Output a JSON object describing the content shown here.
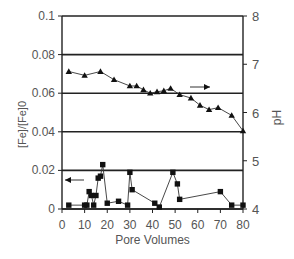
{
  "chart_data": {
    "type": "line",
    "title": "",
    "xlabel": "Pore Volumes",
    "ylabel_left": "[Fe]/[Fe]0",
    "ylabel_right": "pH",
    "xlim": [
      0,
      80
    ],
    "ylim_left": [
      0,
      0.1
    ],
    "ylim_right": [
      4,
      8
    ],
    "x_ticks": [
      "0",
      "10",
      "20",
      "30",
      "40",
      "50",
      "60",
      "70",
      "80"
    ],
    "y_ticks_left": [
      "0",
      "0.02",
      "0.04",
      "0.06",
      "0.08",
      "0.1"
    ],
    "y_ticks_right": [
      "4",
      "5",
      "6",
      "7",
      "8"
    ],
    "grid": "horizontal",
    "series": [
      {
        "name": "pH",
        "axis": "right",
        "marker": "triangle",
        "x": [
          3,
          10,
          17,
          23,
          30,
          33,
          36,
          39,
          42,
          45,
          48,
          52,
          57,
          61,
          65,
          69,
          75,
          80
        ],
        "y": [
          6.85,
          6.77,
          6.85,
          6.68,
          6.55,
          6.55,
          6.47,
          6.4,
          6.43,
          6.45,
          6.5,
          6.37,
          6.3,
          6.15,
          6.06,
          6.1,
          5.94,
          5.62
        ]
      },
      {
        "name": "[Fe]/[Fe]0",
        "axis": "left",
        "marker": "square",
        "x": [
          3,
          10,
          11,
          12,
          13,
          14,
          15,
          16,
          17,
          18,
          20,
          25,
          29,
          30,
          31,
          41,
          43,
          49,
          51,
          52,
          70,
          75,
          80
        ],
        "y": [
          0.002,
          0.002,
          0.002,
          0.009,
          0.007,
          0.002,
          0.007,
          0.016,
          0.017,
          0.023,
          0.003,
          0.004,
          0.002,
          0.019,
          0.01,
          0.003,
          0.001,
          0.019,
          0.013,
          0.005,
          0.009,
          0.002,
          0.002
        ]
      }
    ],
    "annotations": [
      {
        "type": "arrow",
        "direction": "right",
        "meaning": "pH series uses right axis"
      },
      {
        "type": "arrow",
        "direction": "left",
        "meaning": "[Fe]/[Fe]0 series uses left axis"
      }
    ]
  }
}
